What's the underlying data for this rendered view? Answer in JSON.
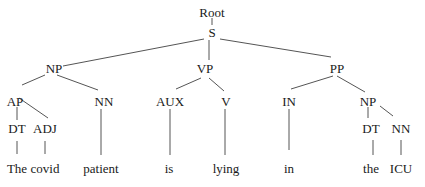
{
  "diagram": {
    "type": "parse-tree",
    "nodes": {
      "root": {
        "label": "Root",
        "x": 212,
        "y": 12
      },
      "s": {
        "label": "S",
        "x": 212,
        "y": 32
      },
      "np1": {
        "label": "NP",
        "x": 54,
        "y": 68
      },
      "vp": {
        "label": "VP",
        "x": 205,
        "y": 68
      },
      "pp": {
        "label": "PP",
        "x": 337,
        "y": 68
      },
      "ap": {
        "label": "AP",
        "x": 15,
        "y": 101
      },
      "nn1": {
        "label": "NN",
        "x": 104,
        "y": 101
      },
      "aux": {
        "label": "AUX",
        "x": 170,
        "y": 101
      },
      "v": {
        "label": "V",
        "x": 226,
        "y": 101
      },
      "in": {
        "label": "IN",
        "x": 289,
        "y": 101
      },
      "np2": {
        "label": "NP",
        "x": 368,
        "y": 101
      },
      "dt1": {
        "label": "DT",
        "x": 17,
        "y": 128
      },
      "adj": {
        "label": "ADJ",
        "x": 45,
        "y": 128
      },
      "dt2": {
        "label": "DT",
        "x": 371,
        "y": 128
      },
      "nn2": {
        "label": "NN",
        "x": 401,
        "y": 128
      },
      "w_the": {
        "label": "The",
        "x": 17,
        "y": 168
      },
      "w_covid": {
        "label": "covid",
        "x": 45,
        "y": 168
      },
      "w_patient": {
        "label": "patient",
        "x": 101,
        "y": 168
      },
      "w_is": {
        "label": "is",
        "x": 169,
        "y": 168
      },
      "w_lying": {
        "label": "lying",
        "x": 226,
        "y": 168
      },
      "w_in": {
        "label": "in",
        "x": 289,
        "y": 168
      },
      "w_the2": {
        "label": "the",
        "x": 371,
        "y": 168
      },
      "w_icu": {
        "label": "ICU",
        "x": 401,
        "y": 168
      }
    },
    "edges": [
      [
        "root",
        "s"
      ],
      [
        "s",
        "np1"
      ],
      [
        "s",
        "vp"
      ],
      [
        "s",
        "pp"
      ],
      [
        "np1",
        "ap"
      ],
      [
        "np1",
        "nn1"
      ],
      [
        "vp",
        "aux"
      ],
      [
        "vp",
        "v"
      ],
      [
        "pp",
        "in"
      ],
      [
        "pp",
        "np2"
      ],
      [
        "ap",
        "dt1"
      ],
      [
        "ap",
        "adj"
      ],
      [
        "np2",
        "dt2"
      ],
      [
        "np2",
        "nn2"
      ],
      [
        "dt1",
        "w_the"
      ],
      [
        "adj",
        "w_covid"
      ],
      [
        "nn1",
        "w_patient"
      ],
      [
        "aux",
        "w_is"
      ],
      [
        "v",
        "w_lying"
      ],
      [
        "in",
        "w_in"
      ],
      [
        "dt2",
        "w_the2"
      ],
      [
        "nn2",
        "w_icu"
      ]
    ],
    "sentence": "The covid patient is lying in the ICU"
  }
}
